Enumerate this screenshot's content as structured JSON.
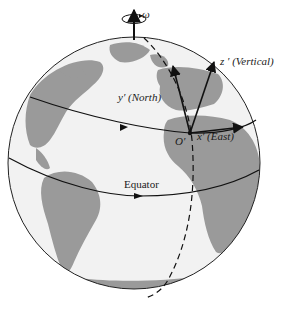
{
  "figure": {
    "colors": {
      "ocean": "#f2f2f2",
      "land": "#9a9a9a",
      "outline": "#222222",
      "arrow": "#111111"
    }
  },
  "labels": {
    "omega": "ω",
    "z_axis": "z ′ (Vertical)",
    "y_axis": "y′ (North)",
    "x_axis": "x′ (East)",
    "origin": "O′",
    "equator": "Equator"
  },
  "icons": {
    "rotation": "circular-arrow-icon",
    "axis_arrow": "arrow-up-icon"
  }
}
